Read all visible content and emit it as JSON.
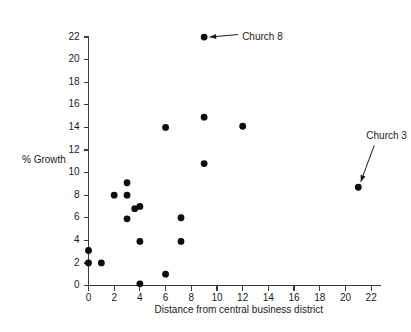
{
  "chart_data": {
    "type": "scatter",
    "title": "",
    "xlabel": "Distance from central business district",
    "ylabel": "% Growth",
    "xlim": [
      0,
      23
    ],
    "ylim": [
      0,
      22.8
    ],
    "xticks": [
      0,
      2,
      4,
      6,
      8,
      10,
      12,
      14,
      16,
      18,
      20,
      22
    ],
    "xtick_labels": [
      "0",
      "2",
      "4",
      "6",
      "8",
      "10",
      "12",
      "14",
      "16",
      "18",
      "20",
      "22"
    ],
    "yticks": [
      0,
      2,
      4,
      6,
      8,
      10,
      12,
      14,
      16,
      18,
      20,
      22
    ],
    "ytick_labels": [
      "0",
      "2",
      "4",
      "6",
      "8",
      "10",
      "12",
      "14",
      "16",
      "18",
      "20",
      "22"
    ],
    "grid": false,
    "legend": false,
    "marker": "filled-circle",
    "marker_color": "#0d0d0d",
    "points": [
      {
        "x": 0,
        "y": 2.0
      },
      {
        "x": 0,
        "y": 3.1
      },
      {
        "x": 1,
        "y": 2.0
      },
      {
        "x": 2,
        "y": 8.0
      },
      {
        "x": 3,
        "y": 9.1
      },
      {
        "x": 3,
        "y": 8.0
      },
      {
        "x": 3,
        "y": 5.9
      },
      {
        "x": 3.6,
        "y": 6.8
      },
      {
        "x": 4,
        "y": 7.0
      },
      {
        "x": 4,
        "y": 3.9
      },
      {
        "x": 4,
        "y": 0.15
      },
      {
        "x": 6,
        "y": 14.0
      },
      {
        "x": 6,
        "y": 1.0
      },
      {
        "x": 7.2,
        "y": 6.0
      },
      {
        "x": 7.2,
        "y": 3.9
      },
      {
        "x": 9,
        "y": 22.0
      },
      {
        "x": 9,
        "y": 14.9
      },
      {
        "x": 9,
        "y": 10.8
      },
      {
        "x": 12,
        "y": 14.1
      },
      {
        "x": 21,
        "y": 8.7
      }
    ],
    "annotations": [
      {
        "label": "Church 8",
        "x": 9,
        "y": 22.0
      },
      {
        "label": "Church 3",
        "x": 21,
        "y": 8.7
      }
    ]
  }
}
